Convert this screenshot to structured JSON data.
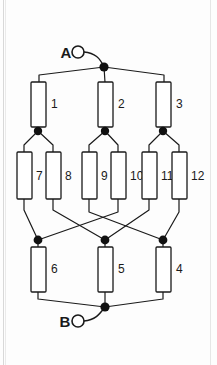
{
  "diagram": {
    "type": "electrical-network-schematic",
    "background_color": "#fdfdfd",
    "line_color": "#1a1a1a",
    "node_color": "#111111",
    "component_fill": "#ffffff",
    "terminals": [
      {
        "id": "A",
        "label": "A",
        "marker": "open-circle",
        "position": "top",
        "cx": 78,
        "cy": 52,
        "r": 6
      },
      {
        "id": "B",
        "label": "B",
        "marker": "open-circle",
        "position": "bottom",
        "cx": 78,
        "cy": 321,
        "r": 6
      }
    ],
    "nodes": [
      {
        "id": "NA",
        "x": 104,
        "y": 67,
        "name": "top-junction-node"
      },
      {
        "id": "N1",
        "x": 38,
        "y": 131,
        "name": "left-upper-node"
      },
      {
        "id": "N2",
        "x": 105,
        "y": 131,
        "name": "center-upper-node"
      },
      {
        "id": "N3",
        "x": 163,
        "y": 131,
        "name": "right-upper-node"
      },
      {
        "id": "M1",
        "x": 38,
        "y": 240,
        "name": "left-lower-node"
      },
      {
        "id": "M2",
        "x": 105,
        "y": 240,
        "name": "center-lower-node"
      },
      {
        "id": "M3",
        "x": 163,
        "y": 240,
        "name": "right-lower-node"
      },
      {
        "id": "NB",
        "x": 105,
        "y": 307,
        "name": "bottom-junction-node"
      }
    ],
    "components": [
      {
        "id": "R1",
        "label": "1",
        "x": 31,
        "y": 82,
        "w": 15,
        "h": 45,
        "label_x": 51,
        "label_y": 108,
        "row": "top",
        "from": "NA",
        "to": "N1"
      },
      {
        "id": "R2",
        "label": "2",
        "x": 98,
        "y": 82,
        "w": 15,
        "h": 45,
        "label_x": 118,
        "label_y": 108,
        "row": "top",
        "from": "NA",
        "to": "N2"
      },
      {
        "id": "R3",
        "label": "3",
        "x": 156,
        "y": 82,
        "w": 15,
        "h": 45,
        "label_x": 176,
        "label_y": 108,
        "row": "top",
        "from": "NA",
        "to": "N3"
      },
      {
        "id": "R7",
        "label": "7",
        "x": 17,
        "y": 152,
        "w": 15,
        "h": 47,
        "label_x": 36,
        "label_y": 180,
        "row": "middle",
        "from": "N1",
        "to": "M1"
      },
      {
        "id": "R8",
        "label": "8",
        "x": 46,
        "y": 152,
        "w": 15,
        "h": 47,
        "label_x": 65,
        "label_y": 180,
        "row": "middle",
        "from": "N1",
        "to": "M2"
      },
      {
        "id": "R9",
        "label": "9",
        "x": 82,
        "y": 152,
        "w": 15,
        "h": 47,
        "label_x": 101,
        "label_y": 180,
        "row": "middle",
        "from": "N2",
        "to": "M3"
      },
      {
        "id": "R10",
        "label": "10",
        "x": 111,
        "y": 152,
        "w": 15,
        "h": 47,
        "label_x": 130,
        "label_y": 180,
        "row": "middle",
        "from": "N2",
        "to": "M1"
      },
      {
        "id": "R11",
        "label": "11",
        "x": 142,
        "y": 152,
        "w": 15,
        "h": 47,
        "label_x": 161,
        "label_y": 180,
        "row": "middle",
        "from": "N3",
        "to": "M2"
      },
      {
        "id": "R12",
        "label": "12",
        "x": 172,
        "y": 152,
        "w": 15,
        "h": 47,
        "label_x": 191,
        "label_y": 180,
        "row": "middle",
        "from": "N3",
        "to": "M3"
      },
      {
        "id": "R6",
        "label": "6",
        "x": 31,
        "y": 247,
        "w": 15,
        "h": 45,
        "label_x": 51,
        "label_y": 273,
        "row": "bottom",
        "from": "M1",
        "to": "NB"
      },
      {
        "id": "R5",
        "label": "5",
        "x": 98,
        "y": 247,
        "w": 15,
        "h": 45,
        "label_x": 118,
        "label_y": 273,
        "row": "bottom",
        "from": "M2",
        "to": "NB"
      },
      {
        "id": "R4",
        "label": "4",
        "x": 156,
        "y": 247,
        "w": 15,
        "h": 45,
        "label_x": 176,
        "label_y": 273,
        "row": "bottom",
        "from": "M3",
        "to": "NB"
      }
    ],
    "component_count": 12,
    "terminal_a_text": "A",
    "terminal_b_text": "B"
  }
}
